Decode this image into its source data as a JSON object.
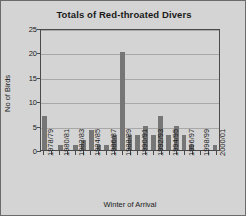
{
  "chart_data": {
    "type": "bar",
    "title": "Totals of Red-throated Divers",
    "xlabel": "Winter of Arrival",
    "ylabel": "No of Birds",
    "ylim": [
      0,
      25
    ],
    "ytick_values": [
      25,
      20,
      15,
      10,
      5,
      0
    ],
    "ytick_labels": [
      "25",
      "20",
      "15",
      "10",
      "5",
      "0"
    ],
    "grid": true,
    "legend": false,
    "legend_position": "none",
    "categories": [
      "1978/79",
      "1979/80",
      "1980/81",
      "1981/82",
      "1982/83",
      "1983/84",
      "1984/85",
      "1985/86",
      "1986/87",
      "1987/88",
      "1988/89",
      "1989/90",
      "1990/91",
      "1991/92",
      "1992/93",
      "1993/94",
      "1994/95",
      "1995/96",
      "1996/97",
      "1997/98",
      "1998/99",
      "1999/00",
      "2000/01"
    ],
    "tick_label_interval": 2,
    "visible_xtick_labels": [
      "1978/79",
      "",
      "1980/81",
      "",
      "1982/83",
      "",
      "1984/85",
      "",
      "1986/87",
      "",
      "1988/89",
      "",
      "1990/91",
      "",
      "1992/93",
      "",
      "1994/95",
      "",
      "1996/97",
      "",
      "1998/99",
      "",
      "2000/01"
    ],
    "values": [
      7,
      0,
      1,
      0,
      1,
      2,
      4,
      1,
      1,
      3,
      20,
      3,
      3,
      5,
      3,
      7,
      3,
      5,
      3,
      1,
      0,
      0,
      1
    ],
    "bar_color": "#767676",
    "plot_background": "#d4d4d4",
    "axis_color": "#4a4a4a",
    "gridline_color": "#a8a8a8",
    "text_color": "#1a1a1a"
  }
}
